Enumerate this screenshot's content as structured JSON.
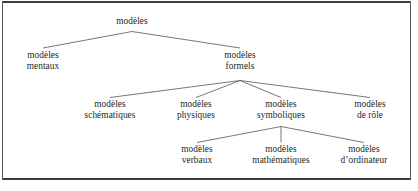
{
  "figure": {
    "language": "fr",
    "background_color": "#ffffff",
    "frame_color": "#3a3d41",
    "line_color": "#53565a",
    "text_color": "#1d1f21"
  },
  "tree": {
    "root": {
      "id": "modeles",
      "line1": "modèles",
      "line2": ""
    },
    "level2": [
      {
        "id": "modeles-mentaux",
        "line1": "modèles",
        "line2": "mentaux"
      },
      {
        "id": "modeles-formels",
        "line1": "modèles",
        "line2": "formels"
      }
    ],
    "level3": [
      {
        "id": "modeles-schematiques",
        "line1": "modèles",
        "line2": "schématiques"
      },
      {
        "id": "modeles-physiques",
        "line1": "modèles",
        "line2": "physiques"
      },
      {
        "id": "modeles-symboliques",
        "line1": "modèles",
        "line2": "symboliques"
      },
      {
        "id": "modeles-de-role",
        "line1": "modèles",
        "line2": "de rôle"
      }
    ],
    "level4": [
      {
        "id": "modeles-verbaux",
        "line1": "modèles",
        "line2": "verbaux"
      },
      {
        "id": "modeles-mathematiques",
        "line1": "modèles",
        "line2": "mathématiques"
      },
      {
        "id": "modeles-ordinateur",
        "line1": "modèles",
        "line2": "d’ordinateur"
      }
    ]
  }
}
